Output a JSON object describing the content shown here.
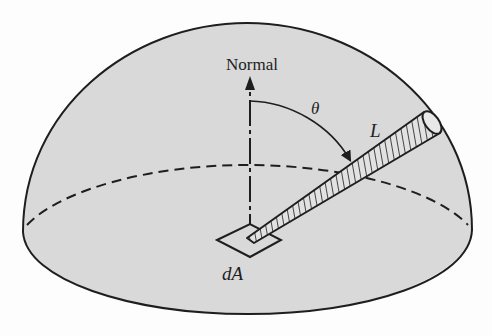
{
  "figure": {
    "labels": {
      "normal": "Normal",
      "theta": "θ",
      "radiance": "L",
      "area": "dA"
    },
    "colors": {
      "background": "#fdfdfd",
      "hemisphere_fill": "#d9d9d9",
      "stroke": "#1e1e1e",
      "beam_fill": "#e2e2e2"
    },
    "elements": {
      "hemisphere": "hemisphere dome outline",
      "equator": "dashed rear half of base ellipse",
      "base_front": "solid front half of base ellipse",
      "normal_arrow": "vertical normal arrow from dA",
      "theta_arc": "arc with arrow from normal to beam",
      "beam": "hatched cylinder from dA to hemisphere surface",
      "area_patch": "parallelogram representing dA"
    }
  }
}
